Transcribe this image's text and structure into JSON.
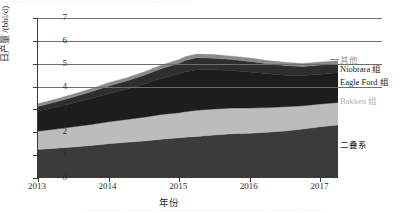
{
  "page": {
    "top_cutoff_text": "⋯⋯⋯⋯  ⋯⋯ ⋯ ⋯⋯ ⋯⋯⋯ ⋯ ⋯⋯⋯⋯ ⋯⋯ ⋯ ⋯⋯",
    "bottom_cutoff_text": "⋯⋯⋯⋯⋯ ⋯⋯⋯⋯ ⋯⋯ ⋯⋯⋯⋯ ⋯⋯⋯⋯⋯ ⋯⋯ ⋯⋯⋯⋯ ⋯⋯⋯"
  },
  "chart_data": {
    "type": "area",
    "title": "",
    "xlabel": "年份",
    "ylabel": "日产量 /(bbl/d)",
    "xlim": [
      2013.0,
      2017.25
    ],
    "ylim": [
      0,
      7
    ],
    "yticks": [
      0,
      1,
      2,
      3,
      4,
      5,
      6,
      7
    ],
    "ytick_labels": [
      "0",
      "1",
      "2",
      "3",
      "4",
      "5",
      "6",
      "7"
    ],
    "xticks": [
      2013,
      2014,
      2015,
      2016,
      2017
    ],
    "xtick_labels": [
      "2013",
      "2014",
      "2015",
      "2016",
      "2017"
    ],
    "gridlines_at": [
      4,
      5,
      6,
      7
    ],
    "grid": true,
    "legend_position": "right-direct-labels",
    "stacked": true,
    "x": [
      2013.0,
      2013.25,
      2013.5,
      2013.75,
      2014.0,
      2014.25,
      2014.5,
      2014.75,
      2015.0,
      2015.08,
      2015.25,
      2015.5,
      2015.75,
      2016.0,
      2016.25,
      2016.5,
      2016.75,
      2017.0,
      2017.25
    ],
    "series": [
      {
        "name": "二叠系",
        "color": "#3b3b3b",
        "label_color": "#1a1a1a",
        "values": [
          1.25,
          1.3,
          1.36,
          1.42,
          1.5,
          1.56,
          1.62,
          1.7,
          1.76,
          1.78,
          1.82,
          1.88,
          1.94,
          1.96,
          2.0,
          2.06,
          2.14,
          2.24,
          2.32
        ]
      },
      {
        "name": "Bakken 组",
        "color": "#bcbcbc",
        "label_color": "#b4b4b4",
        "values": [
          0.8,
          0.84,
          0.88,
          0.92,
          0.96,
          1.0,
          1.04,
          1.08,
          1.1,
          1.12,
          1.14,
          1.14,
          1.12,
          1.1,
          1.08,
          1.06,
          1.02,
          1.0,
          0.98
        ]
      },
      {
        "name": "Eagle Ford 组",
        "color": "#1d1d1d",
        "label_color": "#1a1a1a",
        "values": [
          0.88,
          0.96,
          1.04,
          1.14,
          1.24,
          1.32,
          1.44,
          1.58,
          1.7,
          1.74,
          1.78,
          1.72,
          1.64,
          1.58,
          1.48,
          1.38,
          1.32,
          1.3,
          1.3
        ]
      },
      {
        "name": "Niobrara 组",
        "color": "#2e2e2e",
        "label_color": "#1a1a1a",
        "values": [
          0.2,
          0.23,
          0.26,
          0.29,
          0.33,
          0.36,
          0.39,
          0.43,
          0.46,
          0.5,
          0.52,
          0.5,
          0.48,
          0.46,
          0.44,
          0.42,
          0.4,
          0.4,
          0.4
        ]
      },
      {
        "name": "其他",
        "color": "#8a8a8a",
        "label_color": "#aeaeae",
        "values": [
          0.12,
          0.12,
          0.13,
          0.13,
          0.14,
          0.14,
          0.15,
          0.15,
          0.16,
          0.16,
          0.16,
          0.16,
          0.15,
          0.15,
          0.14,
          0.14,
          0.13,
          0.13,
          0.13
        ]
      }
    ],
    "totals": [
      3.25,
      3.45,
      3.67,
      3.9,
      4.17,
      4.38,
      4.64,
      4.94,
      5.18,
      5.3,
      5.42,
      5.4,
      5.33,
      5.25,
      5.14,
      5.06,
      5.01,
      5.07,
      5.13
    ]
  },
  "legend": {
    "items": [
      {
        "label": "其他",
        "color": "#8a8a8a",
        "top": 55,
        "style": "dim",
        "dash": true
      },
      {
        "label": "Niobrara 组",
        "color": "#2e2e2e",
        "top": 64,
        "style": "",
        "dash": false
      },
      {
        "label": "Eagle Ford 组",
        "color": "#1d1d1d",
        "top": 77,
        "style": "",
        "dash": false
      },
      {
        "label": "Bakken 组",
        "color": "#bcbcbc",
        "top": 96,
        "style": "faint",
        "dash": false
      },
      {
        "label": "二叠系",
        "color": "#3b3b3b",
        "top": 140,
        "style": "",
        "dash": false
      }
    ]
  }
}
